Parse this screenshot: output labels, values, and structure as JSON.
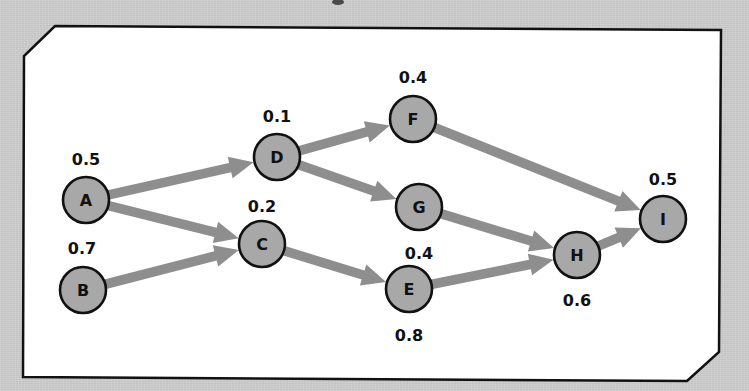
{
  "diagram": {
    "type": "directed-network",
    "colors": {
      "background": "#cdcdcd",
      "panel": "#ffffff",
      "panel_border": "#111111",
      "node_fill": "#a8a8a8",
      "node_stroke": "#111111",
      "edge": "#8e8e8e",
      "text": "#111111"
    },
    "nodes": [
      {
        "id": "A",
        "label": "A",
        "value": "0.5",
        "x": 86,
        "y": 200,
        "vx": 86,
        "vy": 165
      },
      {
        "id": "B",
        "label": "B",
        "value": "0.7",
        "x": 83,
        "y": 290,
        "vx": 82,
        "vy": 254
      },
      {
        "id": "C",
        "label": "C",
        "value": "0.2",
        "x": 262,
        "y": 244,
        "vx": 262,
        "vy": 212
      },
      {
        "id": "D",
        "label": "D",
        "value": "0.1",
        "x": 277,
        "y": 157,
        "vx": 277,
        "vy": 122
      },
      {
        "id": "E",
        "label": "E",
        "value": "0.8",
        "x": 409,
        "y": 289,
        "vx": 409,
        "vy": 341
      },
      {
        "id": "F",
        "label": "F",
        "value": "0.4",
        "x": 413,
        "y": 119,
        "vx": 413,
        "vy": 83
      },
      {
        "id": "G",
        "label": "G",
        "value": "0.4",
        "x": 419,
        "y": 207,
        "vx": 419,
        "vy": 259
      },
      {
        "id": "H",
        "label": "H",
        "value": "0.6",
        "x": 577,
        "y": 255,
        "vx": 577,
        "vy": 306
      },
      {
        "id": "I",
        "label": "I",
        "value": "0.5",
        "x": 663,
        "y": 219,
        "vx": 663,
        "vy": 185
      }
    ],
    "edges": [
      {
        "from": "A",
        "to": "D"
      },
      {
        "from": "A",
        "to": "C"
      },
      {
        "from": "B",
        "to": "C"
      },
      {
        "from": "C",
        "to": "E"
      },
      {
        "from": "D",
        "to": "F"
      },
      {
        "from": "D",
        "to": "G"
      },
      {
        "from": "F",
        "to": "I"
      },
      {
        "from": "G",
        "to": "H"
      },
      {
        "from": "E",
        "to": "H"
      },
      {
        "from": "H",
        "to": "I"
      }
    ]
  }
}
